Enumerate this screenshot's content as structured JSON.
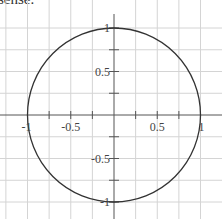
{
  "caption_fragment": "sense.",
  "chart_data": {
    "type": "line",
    "title": "",
    "xlabel": "",
    "ylabel": "",
    "xlim": [
      -1.25,
      1.25
    ],
    "ylim": [
      -1.1,
      1.1
    ],
    "grid": true,
    "grid_step": 0.25,
    "x_ticks": [
      -1,
      -0.5,
      0.5,
      1
    ],
    "x_tick_labels": [
      "-1",
      "-0.5",
      "0.5",
      "1"
    ],
    "y_ticks": [
      1,
      0.5,
      -0.5,
      -1
    ],
    "y_tick_labels": [
      "1",
      "0.5",
      "-0.5",
      "-1"
    ],
    "series": [
      {
        "name": "unit-circle",
        "shape": "circle",
        "center": [
          0,
          0
        ],
        "radius": 1,
        "color": "#333333"
      }
    ]
  }
}
